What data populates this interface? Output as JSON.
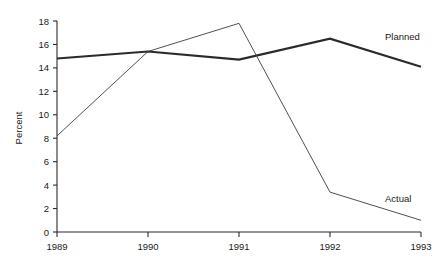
{
  "chart_data": {
    "type": "line",
    "title": "",
    "subtitle": "",
    "xlabel": "",
    "ylabel": "Percent",
    "categories": [
      "1989",
      "1990",
      "1991",
      "1992",
      "1993"
    ],
    "x": [
      1989,
      1990,
      1991,
      1992,
      1993
    ],
    "xlim": [
      1989,
      1993
    ],
    "ylim": [
      0,
      18
    ],
    "y_ticks": [
      "0",
      "2",
      "4",
      "6",
      "8",
      "10",
      "12",
      "14",
      "16",
      "18"
    ],
    "y_tick_values": [
      0,
      2,
      4,
      6,
      8,
      10,
      12,
      14,
      16,
      18
    ],
    "x_ticks": [
      "1989",
      "1990",
      "1991",
      "1992",
      "1993"
    ],
    "grid": false,
    "legend_position": "inline-right",
    "series": [
      {
        "name": "Planned",
        "values": [
          14.8,
          15.4,
          14.7,
          16.5,
          14.1
        ],
        "color": "#2b2b2b",
        "width": "thick"
      },
      {
        "name": "Actual",
        "values": [
          8.2,
          15.4,
          17.8,
          3.4,
          1.0
        ],
        "color": "#3c3c3c",
        "width": "thin"
      }
    ],
    "annotations": [
      {
        "text": "Planned",
        "series": "Planned"
      },
      {
        "text": "Actual",
        "series": "Actual"
      }
    ]
  }
}
